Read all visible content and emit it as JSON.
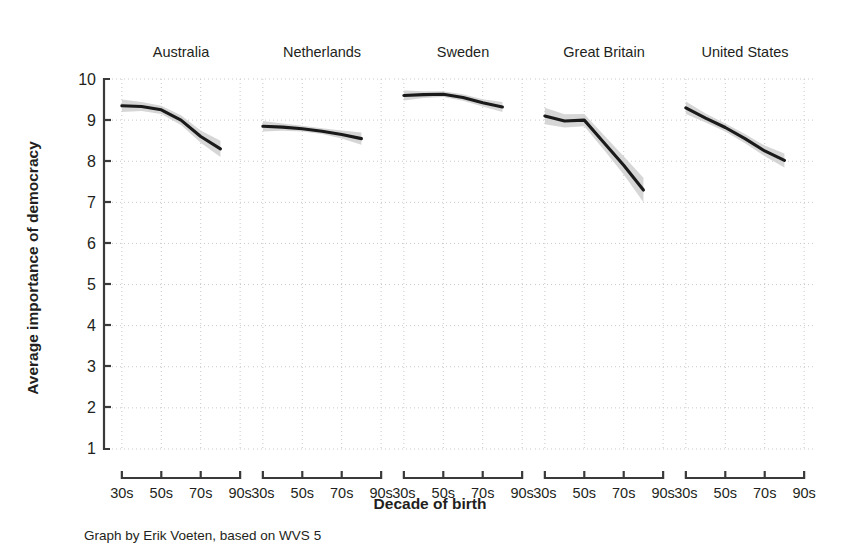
{
  "chart_data": {
    "type": "line",
    "title": "",
    "subtitle": "",
    "xlabel": "Decade of birth",
    "ylabel": "Average importance of democracy",
    "caption": "Graph by Erik Voeten, based on WVS 5",
    "ylim": [
      1,
      10
    ],
    "yticks": [
      1,
      2,
      3,
      4,
      5,
      6,
      7,
      8,
      9,
      10
    ],
    "ytick_labels": [
      "1",
      "2",
      "3",
      "4",
      "5",
      "6",
      "7",
      "8",
      "9",
      "10"
    ],
    "x": [
      1930,
      1940,
      1950,
      1960,
      1970,
      1980
    ],
    "xticks": [
      1930,
      1950,
      1970,
      1990
    ],
    "xtick_labels": [
      "30s",
      "50s",
      "70s",
      "90s"
    ],
    "xlim": [
      1925,
      1995
    ],
    "grid": true,
    "grid_style": "dotted",
    "legend": "none",
    "layout": "small-multiples, 1 row x 5 columns, shared y-axis",
    "band_meaning": "95% confidence interval (shaded gray)",
    "line_color": "#1a1a1a",
    "band_color": "#cfcfcf",
    "panels": [
      {
        "name": "Australia",
        "x": [
          1930,
          1940,
          1950,
          1960,
          1970,
          1980
        ],
        "values": [
          9.35,
          9.33,
          9.25,
          9.0,
          8.6,
          8.3
        ],
        "ci_lower": [
          9.2,
          9.22,
          9.15,
          8.88,
          8.45,
          8.1
        ],
        "ci_upper": [
          9.5,
          9.44,
          9.35,
          9.12,
          8.75,
          8.5
        ]
      },
      {
        "name": "Netherlands",
        "x": [
          1930,
          1940,
          1950,
          1960,
          1970,
          1980
        ],
        "values": [
          8.85,
          8.83,
          8.79,
          8.73,
          8.65,
          8.55
        ],
        "ci_lower": [
          8.72,
          8.74,
          8.72,
          8.66,
          8.55,
          8.4
        ],
        "ci_upper": [
          8.98,
          8.92,
          8.86,
          8.8,
          8.75,
          8.7
        ]
      },
      {
        "name": "Sweden",
        "x": [
          1930,
          1940,
          1950,
          1960,
          1970,
          1980
        ],
        "values": [
          9.6,
          9.62,
          9.63,
          9.55,
          9.42,
          9.32
        ],
        "ci_lower": [
          9.48,
          9.54,
          9.56,
          9.47,
          9.33,
          9.2
        ],
        "ci_upper": [
          9.72,
          9.7,
          9.7,
          9.63,
          9.51,
          9.44
        ]
      },
      {
        "name": "Great Britain",
        "x": [
          1930,
          1940,
          1950,
          1960,
          1970,
          1980
        ],
        "values": [
          9.1,
          8.98,
          9.0,
          8.45,
          7.9,
          7.3
        ],
        "ci_lower": [
          8.9,
          8.82,
          8.85,
          8.27,
          7.68,
          7.0
        ],
        "ci_upper": [
          9.3,
          9.14,
          9.15,
          8.63,
          8.12,
          7.6
        ]
      },
      {
        "name": "United States",
        "x": [
          1930,
          1940,
          1950,
          1960,
          1970,
          1980
        ],
        "values": [
          9.3,
          9.05,
          8.82,
          8.55,
          8.25,
          8.02
        ],
        "ci_lower": [
          9.15,
          8.94,
          8.72,
          8.44,
          8.12,
          7.85
        ],
        "ci_upper": [
          9.45,
          9.16,
          8.92,
          8.66,
          8.38,
          8.19
        ]
      }
    ]
  },
  "axes": {
    "y_title": "Average importance of democracy",
    "x_title": "Decade of birth"
  },
  "caption": {
    "text": "Graph by Erik Voeten, based on WVS 5"
  },
  "ytick_labels": {
    "t10": "10",
    "t9": "9",
    "t8": "8",
    "t7": "7",
    "t6": "6",
    "t5": "5",
    "t4": "4",
    "t3": "3",
    "t2": "2",
    "t1": "1"
  },
  "panel_titles": {
    "p0": "Australia",
    "p1": "Netherlands",
    "p2": "Sweden",
    "p3": "Great Britain",
    "p4": "United States"
  },
  "xtick_labels": {
    "a": "30s",
    "b": "50s",
    "c": "70s",
    "d": "90s"
  }
}
